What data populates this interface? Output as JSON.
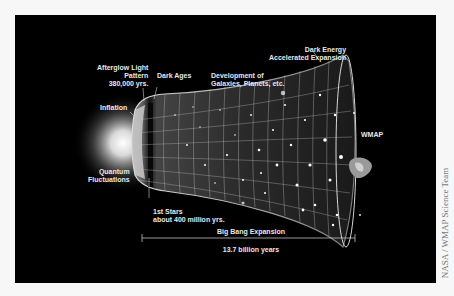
{
  "diagram": {
    "background_color": "#000000",
    "label_color": "#e8e8e8",
    "labels": {
      "afterglow": [
        "Afterglow Light",
        "Pattern",
        "380,000 yrs."
      ],
      "dark_ages": "Dark Ages",
      "development": [
        "Development of",
        "Galaxies, Planets, etc."
      ],
      "dark_energy": [
        "Dark Energy",
        "Accelerated Expansion"
      ],
      "inflation": "Inflation",
      "quantum": [
        "Quantum",
        "Fluctuations"
      ],
      "first_stars": [
        "1st Stars",
        "about 400 million yrs."
      ],
      "wmap": "WMAP",
      "expansion": "Big Bang Expansion",
      "duration": "13.7 billion years"
    },
    "credit": "NASA / WMAP Science Team"
  }
}
